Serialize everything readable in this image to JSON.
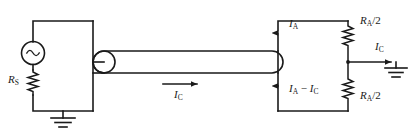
{
  "diagram": {
    "type": "electrical-schematic",
    "stroke_color": "#1a1a1a",
    "background_color": "#ffffff",
    "line_width": 1.6
  },
  "components": {
    "ac_source": {
      "name": "AC voltage source",
      "symbol": "sine-circle",
      "label": ""
    },
    "source_resistor": {
      "name": "Source resistance",
      "symbol": "zigzag-resistor",
      "label_main": "R",
      "label_sub": "S"
    },
    "cable": {
      "name": "Coaxial cable",
      "symbol": "rounded-tube"
    },
    "connector": {
      "name": "Cable connector",
      "symbol": "circle-node"
    },
    "term_resistor_top": {
      "name": "Top termination resistor",
      "symbol": "zigzag-resistor",
      "label_main": "R",
      "label_sub": "A",
      "label_tail": "/2"
    },
    "term_resistor_bottom": {
      "name": "Bottom termination resistor",
      "symbol": "zigzag-resistor",
      "label_main": "R",
      "label_sub": "A",
      "label_tail": "/2"
    },
    "ground_left": {
      "name": "Left ground",
      "symbol": "earth-ground"
    },
    "ground_right": {
      "name": "Right ground",
      "symbol": "earth-ground"
    }
  },
  "labels": {
    "rs": {
      "main": "R",
      "sub": "S"
    },
    "ic_cable": {
      "main": "I",
      "sub": "C"
    },
    "ia_top": {
      "main": "I",
      "sub": "A"
    },
    "ia_minus_ic": {
      "main_a": "I",
      "sub_a": "A",
      "minus": " − ",
      "main_b": "I",
      "sub_b": "C"
    },
    "ra_top": {
      "main": "R",
      "sub": "A",
      "tail": "/2"
    },
    "ra_bottom": {
      "main": "R",
      "sub": "A",
      "tail": "/2"
    },
    "ic_right": {
      "main": "I",
      "sub": "C"
    }
  },
  "arrows": {
    "ic_cable": {
      "direction": "right",
      "meaning": "cable current"
    },
    "ia_top": {
      "direction": "up",
      "meaning": "top branch current"
    },
    "ia_minus_ic": {
      "direction": "up",
      "meaning": "bottom branch current"
    },
    "ic_right": {
      "direction": "right",
      "meaning": "current to ground"
    }
  }
}
